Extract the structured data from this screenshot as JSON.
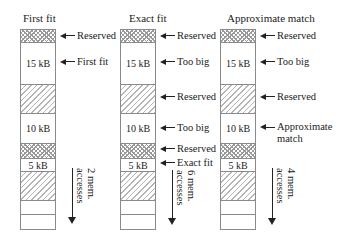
{
  "diagram": {
    "colors": {
      "border": "#8a8a8a",
      "text": "#222222",
      "hatch": "#b5b5b5",
      "crosshatch": "#9a9a9a"
    },
    "columns": [
      {
        "title": "First fit",
        "blocks": [
          {
            "type": "reserved-crosshatch",
            "label": ""
          },
          {
            "type": "free",
            "label": "15 kB"
          },
          {
            "type": "reserved-hatched",
            "label": ""
          },
          {
            "type": "free",
            "label": "10 kB"
          },
          {
            "type": "reserved-crosshatch",
            "label": ""
          },
          {
            "type": "free",
            "label": "5 kB"
          },
          {
            "type": "reserved-hatched",
            "label": ""
          },
          {
            "type": "empty",
            "label": ""
          },
          {
            "type": "empty",
            "label": ""
          }
        ],
        "annotations": [
          "Reserved",
          "First fit"
        ],
        "accesses": {
          "count": "2 mem.",
          "unit": "accesses"
        }
      },
      {
        "title": "Exact fit",
        "blocks": [
          {
            "type": "reserved-crosshatch",
            "label": ""
          },
          {
            "type": "free",
            "label": "15 kB"
          },
          {
            "type": "reserved-hatched",
            "label": ""
          },
          {
            "type": "free",
            "label": "10 kB"
          },
          {
            "type": "reserved-crosshatch",
            "label": ""
          },
          {
            "type": "free",
            "label": "5 kB"
          },
          {
            "type": "reserved-hatched",
            "label": ""
          },
          {
            "type": "empty",
            "label": ""
          },
          {
            "type": "empty",
            "label": ""
          }
        ],
        "annotations": [
          "Reserved",
          "Too big",
          "Reserved",
          "Too big",
          "Reserved",
          "Exact fit"
        ],
        "accesses": {
          "count": "6 mem.",
          "unit": "accesses"
        }
      },
      {
        "title": "Approximate match",
        "blocks": [
          {
            "type": "reserved-crosshatch",
            "label": ""
          },
          {
            "type": "free",
            "label": "15 kB"
          },
          {
            "type": "reserved-hatched",
            "label": ""
          },
          {
            "type": "free",
            "label": "10 kB"
          },
          {
            "type": "reserved-crosshatch",
            "label": ""
          },
          {
            "type": "free",
            "label": "5 kB"
          },
          {
            "type": "reserved-hatched",
            "label": ""
          },
          {
            "type": "empty",
            "label": ""
          },
          {
            "type": "empty",
            "label": ""
          }
        ],
        "annotations": [
          "Reserved",
          "Too big",
          "Reserved",
          "Approximate",
          "match"
        ],
        "accesses": {
          "count": "4 mem.",
          "unit": "accesses"
        }
      }
    ]
  }
}
